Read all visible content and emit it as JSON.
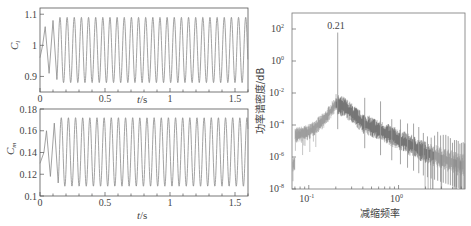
{
  "chart_data": [
    {
      "type": "line",
      "panel": "top-left",
      "ylabel": "C_l",
      "xlabel": "t/s",
      "xlim": [
        0,
        1.6
      ],
      "ylim": [
        0.85,
        1.12
      ],
      "xticks": [
        "0",
        "0.5",
        "1",
        "1.5"
      ],
      "yticks": [
        "0.9",
        "1",
        "1.1"
      ],
      "series": [
        {
          "name": "C_l",
          "description": "Oscillating lift coefficient, initial transient then steady sinusoid",
          "mean": 0.985,
          "amplitude": 0.105,
          "frequency_hz": 18.2,
          "transient_points": [
            [
              0.0,
              0.96
            ],
            [
              0.02,
              1.0
            ],
            [
              0.04,
              1.06
            ],
            [
              0.07,
              0.91
            ],
            [
              0.1,
              1.08
            ],
            [
              0.13,
              0.89
            ]
          ]
        }
      ]
    },
    {
      "type": "line",
      "panel": "bottom-left",
      "ylabel": "C_m",
      "xlabel": "t/s",
      "xlim": [
        0,
        1.6
      ],
      "ylim": [
        0.1,
        0.18
      ],
      "xticks": [
        "0",
        "0.5",
        "1",
        "1.5"
      ],
      "yticks": [
        "0.1",
        "0.12",
        "0.14",
        "0.16",
        "0.18"
      ],
      "series": [
        {
          "name": "C_m",
          "description": "Oscillating moment coefficient, initial transient then steady sinusoid",
          "mean": 0.1405,
          "amplitude": 0.0315,
          "frequency_hz": 18.2,
          "transient_points": [
            [
              0.0,
              0.13
            ],
            [
              0.03,
              0.14
            ],
            [
              0.05,
              0.16
            ],
            [
              0.08,
              0.118
            ],
            [
              0.11,
              0.167
            ],
            [
              0.14,
              0.112
            ]
          ]
        }
      ]
    },
    {
      "type": "line",
      "panel": "right",
      "scale": "log-log",
      "ylabel": "功率谱密度/dB",
      "xlabel": "减缩频率",
      "xlim": [
        0.065,
        5.5
      ],
      "ylim": [
        1e-08,
        1000.0
      ],
      "xticks": [
        "10^-1",
        "10^0"
      ],
      "yticks": [
        "10^2",
        "10^0",
        "10^-2",
        "10^-4",
        "10^-6",
        "10^-8"
      ],
      "annotations": [
        {
          "text": "0.21",
          "x": 0.21,
          "y": 60
        }
      ],
      "series": [
        {
          "name": "PSD",
          "peaks": [
            {
              "x": 0.21,
              "y": 60
            },
            {
              "x": 0.42,
              "y": 0.005
            },
            {
              "x": 0.63,
              "y": 0.003
            }
          ],
          "broadband_points": [
            [
              0.07,
              3e-05
            ],
            [
              0.1,
              5e-05
            ],
            [
              0.15,
              0.0003
            ],
            [
              0.2,
              0.003
            ],
            [
              0.25,
              0.002
            ],
            [
              0.4,
              0.0002
            ],
            [
              0.7,
              5e-05
            ],
            [
              1.0,
              2e-05
            ],
            [
              2.0,
              3e-06
            ],
            [
              5.0,
              5e-07
            ]
          ]
        }
      ]
    }
  ],
  "labels": {
    "cl_ylabel_main": "C",
    "cl_ylabel_sub": "l",
    "cm_ylabel_main": "C",
    "cm_ylabel_sub": "m",
    "xlabel_t": "t",
    "xlabel_unit": "/s",
    "psd_ylabel": "功率谱密度/dB",
    "psd_xlabel": "减缩频率",
    "peak_annotation": "0.21",
    "left_xticks": [
      "0",
      "0.5",
      "1",
      "1.5"
    ],
    "cl_yticks": [
      "1.1",
      "1",
      "0.9"
    ],
    "cm_yticks": [
      "0.18",
      "0.16",
      "0.14",
      "0.12",
      "0.1"
    ],
    "psd_yticks": [
      "2",
      "0",
      "-2",
      "-4",
      "-6",
      "-8"
    ],
    "psd_xticks": [
      "-1",
      "0"
    ],
    "base": "10"
  },
  "colors": {
    "line": "#8a8a8a",
    "dense": "#333333",
    "axis": "#555555"
  }
}
